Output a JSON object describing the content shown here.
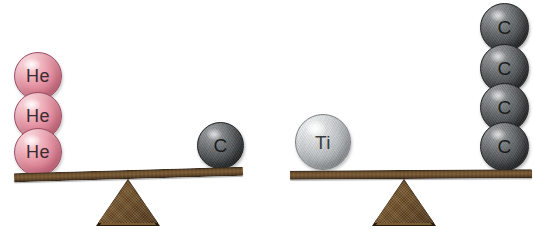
{
  "figure": {
    "name": "atomic-mass-balance-scales",
    "background_color": "#ffffff",
    "width": 534,
    "height": 230
  },
  "palette": {
    "helium_pink": "#e79aa8",
    "carbon_gray": "#64686a",
    "titanium_silver": "#c4c7c9",
    "wood_brown": "#7a5a31",
    "wood_dark": "#241a10",
    "label_text": "#2b2b2b"
  },
  "scales": [
    {
      "id": "scale-left",
      "left_pan": {
        "stack_label": "He",
        "atoms": [
          {
            "label": "He",
            "element": "helium"
          },
          {
            "label": "He",
            "element": "helium"
          },
          {
            "label": "He",
            "element": "helium"
          }
        ],
        "count": 3
      },
      "right_pan": {
        "stack_label": "C",
        "atoms": [
          {
            "label": "C",
            "element": "carbon"
          }
        ],
        "count": 1
      },
      "tilt_degrees": -1.6,
      "beam_state": "tipped-left"
    },
    {
      "id": "scale-right",
      "left_pan": {
        "stack_label": "Ti",
        "atoms": [
          {
            "label": "Ti",
            "element": "titanium"
          }
        ],
        "count": 1
      },
      "right_pan": {
        "stack_label": "C",
        "atoms": [
          {
            "label": "C",
            "element": "carbon"
          },
          {
            "label": "C",
            "element": "carbon"
          },
          {
            "label": "C",
            "element": "carbon"
          },
          {
            "label": "C",
            "element": "carbon"
          }
        ],
        "count": 4
      },
      "tilt_degrees": -0.4,
      "beam_state": "nearly-level"
    }
  ],
  "labels": {
    "helium": "He",
    "carbon": "C",
    "titanium": "Ti"
  }
}
